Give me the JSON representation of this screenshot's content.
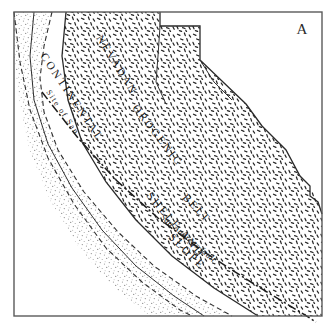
{
  "figure": {
    "panel_letter": "A",
    "type": "geologic-sketch-map",
    "background_color": "#ffffff",
    "frame_color": "#5a5a5a"
  },
  "labels": {
    "continental_shelf": "CONTINENTAL SHELF AND SLOPE",
    "site_of": "Site of San",
    "nevadan_belt": "NEVADAN OROGENIC BELT",
    "san_andreas_fault": "San Andreas fault"
  },
  "label_segments": {
    "shelf_line1": "CONTINENTAL",
    "shelf_line2": "SHELF AND",
    "shelf_line3": "SLOPE",
    "nevadan_word1": "NEVADAN",
    "nevadan_word2": "OROGENIC",
    "nevadan_word3": "BELT",
    "site_small": "Site of San"
  },
  "units": [
    {
      "name": "continental-shelf-and-slope",
      "label": "CONTINENTAL SHELF AND SLOPE",
      "pattern": "fine-dot-stipple",
      "pattern_color": "#8e8e8e",
      "boundary": "dashed"
    },
    {
      "name": "nevadan-orogenic-belt",
      "label": "NEVADAN OROGENIC BELT",
      "pattern": "short-dash-stipple",
      "pattern_color": "#252525",
      "boundary": "solid"
    }
  ],
  "structures": [
    {
      "name": "san-andreas-fault",
      "label": "San Andreas fault",
      "style": "dash-dot-line",
      "color": "#1c1c1c"
    }
  ]
}
